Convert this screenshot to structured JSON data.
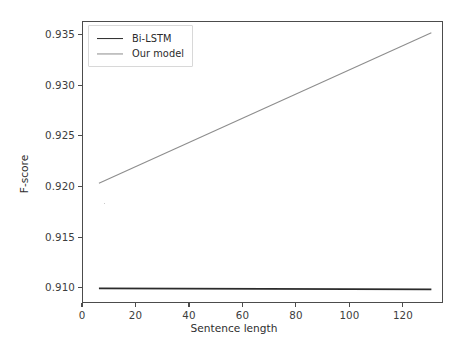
{
  "chart_data": {
    "type": "line",
    "title": "",
    "xlabel": "Sentence length",
    "ylabel": "F-score",
    "xlim": [
      0,
      135
    ],
    "ylim": [
      0.9085,
      0.93635
    ],
    "grid": false,
    "legend_position": "upper left",
    "xticks": [
      0,
      20,
      40,
      60,
      80,
      100,
      120
    ],
    "xtick_labels": [
      "0",
      "20",
      "40",
      "60",
      "80",
      "100",
      "120"
    ],
    "yticks": [
      0.91,
      0.915,
      0.92,
      0.925,
      0.93,
      0.935
    ],
    "ytick_labels": [
      "0.910",
      "0.915",
      "0.920",
      "0.925",
      "0.930",
      "0.935"
    ],
    "series": [
      {
        "name": "Bi-LSTM",
        "color": "#2b2b2b",
        "linewidth": 1.9,
        "x": [
          6,
          131
        ],
        "values": [
          0.90985,
          0.90975
        ]
      },
      {
        "name": "Our model",
        "color": "#8d8d8d",
        "linewidth": 1.1,
        "x": [
          6,
          131
        ],
        "values": [
          0.92032,
          0.93528
        ]
      }
    ],
    "annotations": [
      {
        "name": "stray-dot",
        "x": 8,
        "y": 0.91842
      }
    ]
  },
  "legend": {
    "entries": [
      {
        "label": "Bi-LSTM",
        "color": "#2b2b2b",
        "linewidth": 1.9
      },
      {
        "label": "Our model",
        "color": "#8d8d8d",
        "linewidth": 1.1
      }
    ]
  },
  "axes": {
    "frame_color": "#4c4c4c",
    "tick_color": "#3d3d3d",
    "background": "#ffffff"
  }
}
